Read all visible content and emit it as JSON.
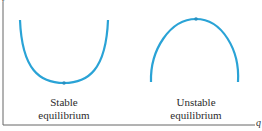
{
  "axes": {
    "x_label": "q",
    "y_label": "V"
  },
  "curves": [
    {
      "name": "stable",
      "shape": "U",
      "label_line1": "Stable",
      "label_line2": "equilibrium"
    },
    {
      "name": "unstable",
      "shape": "inverted-U",
      "label_line1": "Unstable",
      "label_line2": "equilibrium"
    }
  ],
  "colors": {
    "curve": "#2aa3d6",
    "axis": "#555555"
  }
}
